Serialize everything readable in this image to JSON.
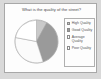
{
  "window": {
    "background_color": "#d9d9d9",
    "card_background_color": "#fdfdfd",
    "card_border_color": "#a8a8a8"
  },
  "chart_panel": {
    "title": "What is the quality of the street?",
    "legend_border_color": "#b0b0b0"
  },
  "legend": {
    "items": [
      {
        "label": "High Quality",
        "color": "#c9c9c9"
      },
      {
        "label": "Good Quality",
        "color": "#9a9a9a"
      },
      {
        "label": "Average Quality",
        "color": "#fbfbfb"
      },
      {
        "label": "Poor Quality",
        "color": "#ffffff"
      }
    ]
  },
  "chart_data": {
    "type": "pie",
    "title": "What is the quality of the street?",
    "xlabel": "",
    "ylabel": "",
    "legend_position": "right",
    "grid": false,
    "categories": [
      "High Quality",
      "Good Quality",
      "Average Quality",
      "Poor Quality"
    ],
    "values": [
      8,
      37,
      33,
      22
    ],
    "unit": "percent",
    "colors": [
      "#c9c9c9",
      "#9a9a9a",
      "#fbfbfb",
      "#ffffff"
    ],
    "slice_outline_color": "#a0a0a0",
    "start_angle_deg": -90,
    "direction": "clockwise",
    "series": [
      {
        "name": "Street quality responses",
        "values": [
          8,
          37,
          33,
          22
        ]
      }
    ]
  }
}
